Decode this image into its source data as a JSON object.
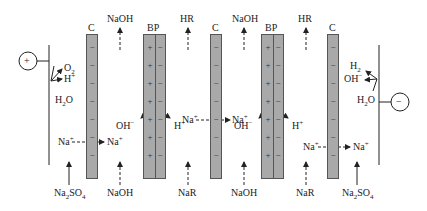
{
  "diagram": {
    "type": "bipolar membrane electrodialysis cell",
    "electrodes": {
      "anode": {
        "symbol": "+",
        "label": "anode"
      },
      "cathode": {
        "symbol": "−",
        "label": "cathode"
      }
    },
    "membranes": [
      {
        "id": "C1",
        "label": "C",
        "type": "cation-exchange",
        "sign": "−"
      },
      {
        "id": "BP1",
        "label": "BP",
        "type": "bipolar",
        "left_sign": "+",
        "right_sign": "−"
      },
      {
        "id": "C2",
        "label": "C",
        "type": "cation-exchange",
        "sign": "−"
      },
      {
        "id": "BP2",
        "label": "BP",
        "type": "bipolar",
        "left_sign": "+",
        "right_sign": "−"
      },
      {
        "id": "C3",
        "label": "C",
        "type": "cation-exchange",
        "sign": "−"
      }
    ],
    "top_outputs": [
      "NaOH",
      "HR",
      "NaOH",
      "HR"
    ],
    "bottom_inputs": [
      "Na2SO4",
      "NaOH",
      "NaR",
      "NaOH",
      "NaR",
      "Na2SO4"
    ],
    "anode_reaction": {
      "reactant": "H2O",
      "products": [
        "O2",
        "H+"
      ]
    },
    "cathode_reaction": {
      "reactant": "H2O",
      "products": [
        "H2",
        "OH−"
      ]
    },
    "bipolar_split": {
      "left": "OH−",
      "right": "H+"
    },
    "ion_transport": [
      {
        "ion": "Na+",
        "from": "anode compartment",
        "to": "base compartment",
        "through": "C1"
      },
      {
        "ion": "Na+",
        "from": "salt compartment",
        "to": "base compartment",
        "through": "C2"
      },
      {
        "ion": "Na+",
        "from": "salt compartment",
        "to": "cathode compartment",
        "through": "C3"
      }
    ]
  },
  "text": {
    "c": "C",
    "bp": "BP",
    "naoh": "NaOH",
    "hr": "HR",
    "nar": "NaR",
    "na": "Na",
    "oh": "OH",
    "h": "H",
    "plus": "+",
    "minus": "−",
    "o": "O",
    "so": "SO",
    "two": "2",
    "four": "4"
  },
  "colors": {
    "membrane_fill": "#a9a9a9",
    "membrane_border": "#555555",
    "line": "#222222",
    "background": "#ffffff"
  }
}
